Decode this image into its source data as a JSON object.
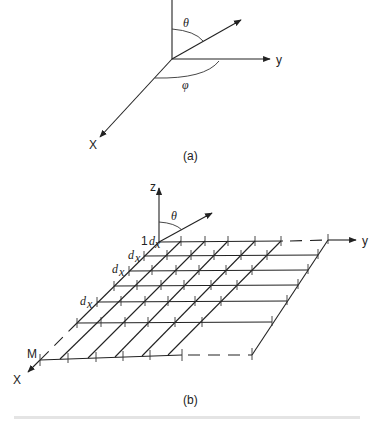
{
  "figure_a": {
    "label": "(a)",
    "axes": {
      "x": "X",
      "y": "y"
    },
    "angles": {
      "theta": "θ",
      "phi": "φ"
    }
  },
  "figure_b": {
    "label": "(b)",
    "axes": {
      "x": "X",
      "y": "y",
      "z": "z"
    },
    "angles": {
      "theta": "θ"
    },
    "row_labels": {
      "first_index": "1",
      "spacing": "d",
      "spacing_sub": "x",
      "last_index": "M"
    }
  },
  "caption": ""
}
